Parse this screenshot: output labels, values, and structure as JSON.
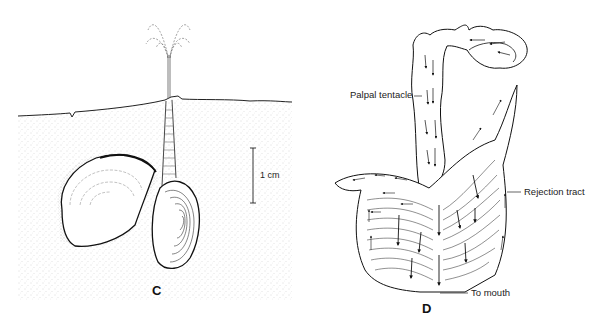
{
  "figure": {
    "panels": [
      {
        "id": "C",
        "letter": "C",
        "subject": "bivalve burrowed in sediment with siphon extended above surface",
        "scale_bar": {
          "label": "1 cm"
        }
      },
      {
        "id": "D",
        "letter": "D",
        "subject": "labial palp ciliary feeding currents",
        "labels": {
          "palpal_tentacle": "Palpal tentacle",
          "rejection_tract": "Rejection tract",
          "to_mouth": "To mouth"
        }
      }
    ]
  },
  "colors": {
    "ink": "#1a1a1a",
    "sediment": "#b8b8b8",
    "background": "#ffffff"
  }
}
